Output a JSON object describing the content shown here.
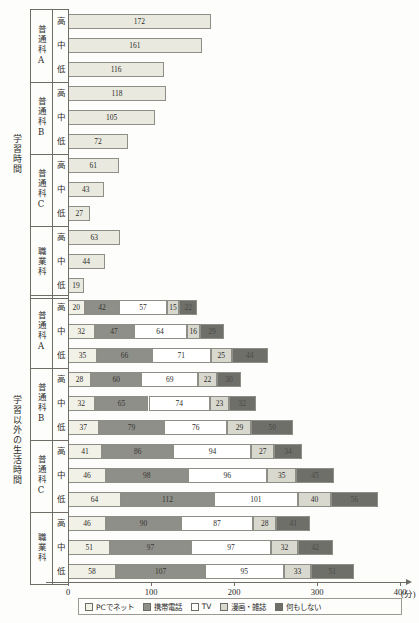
{
  "chart_data": {
    "type": "bar",
    "title": "",
    "xlabel": "400(分)",
    "ylabel": "",
    "xlim": [
      0,
      400
    ],
    "xticks": [
      0,
      100,
      200,
      300,
      400
    ],
    "xtick_labels": [
      "0",
      "100",
      "200",
      "300",
      "400"
    ],
    "xunit_label": "(分)",
    "grid": false,
    "legend_position": "bottom",
    "orientation": "horizontal",
    "sections": [
      {
        "name": "学習時間",
        "stacked": false,
        "groups": [
          {
            "name": "普通科A",
            "rows": [
              {
                "level": "高",
                "values": [
                  172
                ]
              },
              {
                "level": "中",
                "values": [
                  161
                ]
              },
              {
                "level": "低",
                "values": [
                  116
                ]
              }
            ]
          },
          {
            "name": "普通科B",
            "rows": [
              {
                "level": "高",
                "values": [
                  118
                ]
              },
              {
                "level": "中",
                "values": [
                  105
                ]
              },
              {
                "level": "低",
                "values": [
                  72
                ]
              }
            ]
          },
          {
            "name": "普通科C",
            "rows": [
              {
                "level": "高",
                "values": [
                  61
                ]
              },
              {
                "level": "中",
                "values": [
                  43
                ]
              },
              {
                "level": "低",
                "values": [
                  27
                ]
              }
            ]
          },
          {
            "name": "職業科",
            "rows": [
              {
                "level": "高",
                "values": [
                  63
                ]
              },
              {
                "level": "中",
                "values": [
                  44
                ]
              },
              {
                "level": "低",
                "values": [
                  19
                ]
              }
            ]
          }
        ]
      },
      {
        "name": "学習以外の生活時間",
        "stacked": true,
        "groups": [
          {
            "name": "普通科A",
            "rows": [
              {
                "level": "高",
                "values": [
                  20,
                  42,
                  57,
                  15,
                  22
                ]
              },
              {
                "level": "中",
                "values": [
                  32,
                  47,
                  64,
                  16,
                  29
                ]
              },
              {
                "level": "低",
                "values": [
                  35,
                  66,
                  71,
                  25,
                  44
                ]
              }
            ]
          },
          {
            "name": "普通科B",
            "rows": [
              {
                "level": "高",
                "values": [
                  28,
                  60,
                  69,
                  22,
                  30
                ]
              },
              {
                "level": "中",
                "values": [
                  32,
                  65,
                  74,
                  23,
                  32
                ]
              },
              {
                "level": "低",
                "values": [
                  37,
                  79,
                  76,
                  29,
                  50
                ]
              }
            ]
          },
          {
            "name": "普通科C",
            "rows": [
              {
                "level": "高",
                "values": [
                  41,
                  86,
                  94,
                  27,
                  34
                ]
              },
              {
                "level": "中",
                "values": [
                  46,
                  98,
                  96,
                  35,
                  45
                ]
              },
              {
                "level": "低",
                "values": [
                  64,
                  112,
                  101,
                  40,
                  56
                ]
              }
            ]
          },
          {
            "name": "職業科",
            "rows": [
              {
                "level": "高",
                "values": [
                  46,
                  90,
                  87,
                  28,
                  41
                ]
              },
              {
                "level": "中",
                "values": [
                  51,
                  97,
                  97,
                  32,
                  42
                ]
              },
              {
                "level": "低",
                "values": [
                  58,
                  107,
                  95,
                  33,
                  51
                ]
              }
            ]
          }
        ]
      }
    ],
    "legend": [
      {
        "label": "PCでネット",
        "color": "#f2f1e7",
        "key": "net"
      },
      {
        "label": "携帯電話",
        "color": "#8f8f8a",
        "key": "mobile"
      },
      {
        "label": "TV",
        "color": "#ffffff",
        "key": "tv"
      },
      {
        "label": "漫画・雑誌",
        "color": "#d9d8ce",
        "key": "manga"
      },
      {
        "label": "何もしない",
        "color": "#6f6f6a",
        "key": "none"
      }
    ],
    "series_colors": [
      "#f2f1e7",
      "#8f8f8a",
      "#ffffff",
      "#d9d8ce",
      "#6f6f6a"
    ],
    "study_bar_color": "#e9e9df",
    "axis_color": "#6d6d66"
  }
}
